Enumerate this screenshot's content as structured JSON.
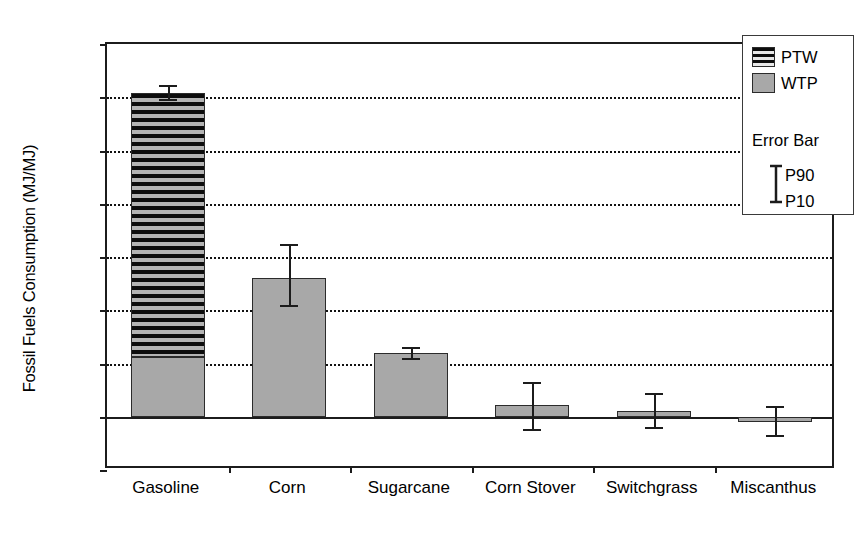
{
  "chart_data": {
    "type": "bar",
    "title": "",
    "xlabel": "",
    "ylabel": "Fossil Fuels Consumption (MJ/MJ)",
    "ylim": [
      -0.2,
      1.4
    ],
    "ytick_labels": [
      "1.4",
      "1.2",
      "1.0",
      "0.8",
      "0.6",
      "0.4",
      "0.2",
      "0.0",
      "-0.2"
    ],
    "ytick_values": [
      1.4,
      1.2,
      1.0,
      0.8,
      0.6,
      0.4,
      0.2,
      0.0,
      -0.2
    ],
    "grid": "horizontal-dotted",
    "stacked": true,
    "categories": [
      "Gasoline",
      "Corn",
      "Sugarcane",
      "Corn Stover",
      "Switchgrass",
      "Miscanthus"
    ],
    "series": [
      {
        "name": "WTP",
        "color": "#a8a8a8",
        "values": [
          0.225,
          0.52,
          0.24,
          0.045,
          0.02,
          -0.02
        ]
      },
      {
        "name": "PTW",
        "color": "#0d0d0d",
        "pattern": "horizontal-hatch",
        "values": [
          0.99,
          0.0,
          0.0,
          0.0,
          0.0,
          0.0
        ]
      }
    ],
    "totals": [
      1.215,
      0.52,
      0.24,
      0.045,
      0.02,
      -0.02
    ],
    "error_bars": {
      "low_label": "P10",
      "high_label": "P90",
      "p10": [
        1.195,
        0.42,
        0.222,
        -0.045,
        -0.04,
        -0.07
      ],
      "p90": [
        1.245,
        0.65,
        0.262,
        0.13,
        0.09,
        0.04
      ]
    },
    "legend": {
      "position": "top-right",
      "entries": [
        {
          "label": "PTW",
          "swatch": "hatch"
        },
        {
          "label": "WTP",
          "swatch": "gray"
        }
      ],
      "error_bar_title": "Error Bar",
      "error_bar_high": "P90",
      "error_bar_low": "P10"
    }
  }
}
